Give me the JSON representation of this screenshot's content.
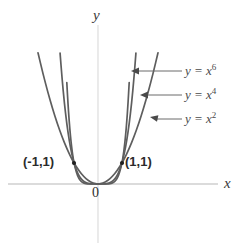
{
  "chart_data": {
    "type": "line",
    "title": "",
    "xlabel": "x",
    "ylabel": "y",
    "xlim": [
      -2.1,
      2.1
    ],
    "ylim": [
      -0.55,
      5.9
    ],
    "grid": false,
    "legend_position": "right-inline-annotations",
    "axes": {
      "x_label": "x",
      "y_label": "y",
      "origin_label": "0",
      "origin_pixel": [
        98,
        184
      ],
      "unit_px_x": 24,
      "unit_px_y": 21
    },
    "series": [
      {
        "name": "y = x^6",
        "label_text": "y = x",
        "label_exponent": "6",
        "exponent": 6,
        "color": "#5e5e5e",
        "points": [
          [
            -1.36,
            6.35
          ],
          [
            -1.3,
            4.83
          ],
          [
            -1.25,
            3.81
          ],
          [
            -1.2,
            2.99
          ],
          [
            -1.15,
            2.31
          ],
          [
            -1.1,
            1.77
          ],
          [
            -1.05,
            1.34
          ],
          [
            -1.0,
            1.0
          ],
          [
            -0.9,
            0.531
          ],
          [
            -0.8,
            0.262
          ],
          [
            -0.7,
            0.118
          ],
          [
            -0.6,
            0.047
          ],
          [
            -0.5,
            0.016
          ],
          [
            -0.4,
            0.004
          ],
          [
            -0.3,
            0.0007
          ],
          [
            -0.2,
            6e-05
          ],
          [
            0,
            0
          ],
          [
            0.2,
            6e-05
          ],
          [
            0.3,
            0.0007
          ],
          [
            0.4,
            0.004
          ],
          [
            0.5,
            0.016
          ],
          [
            0.6,
            0.047
          ],
          [
            0.7,
            0.118
          ],
          [
            0.8,
            0.262
          ],
          [
            0.9,
            0.531
          ],
          [
            1.0,
            1.0
          ],
          [
            1.05,
            1.34
          ],
          [
            1.1,
            1.77
          ],
          [
            1.15,
            2.31
          ],
          [
            1.2,
            2.99
          ],
          [
            1.25,
            3.81
          ],
          [
            1.3,
            4.83
          ],
          [
            1.36,
            6.35
          ]
        ]
      },
      {
        "name": "y = x^4",
        "label_text": "y = x",
        "label_exponent": "4",
        "exponent": 4,
        "color": "#5e5e5e",
        "points": [
          [
            -1.58,
            6.23
          ],
          [
            -1.5,
            5.06
          ],
          [
            -1.4,
            3.84
          ],
          [
            -1.3,
            2.86
          ],
          [
            -1.2,
            2.07
          ],
          [
            -1.1,
            1.46
          ],
          [
            -1.0,
            1.0
          ],
          [
            -0.9,
            0.656
          ],
          [
            -0.8,
            0.41
          ],
          [
            -0.7,
            0.24
          ],
          [
            -0.6,
            0.13
          ],
          [
            -0.5,
            0.0625
          ],
          [
            -0.4,
            0.026
          ],
          [
            -0.3,
            0.008
          ],
          [
            -0.2,
            0.0016
          ],
          [
            0,
            0
          ],
          [
            0.2,
            0.0016
          ],
          [
            0.3,
            0.008
          ],
          [
            0.4,
            0.026
          ],
          [
            0.5,
            0.0625
          ],
          [
            0.6,
            0.13
          ],
          [
            0.7,
            0.24
          ],
          [
            0.8,
            0.41
          ],
          [
            0.9,
            0.656
          ],
          [
            1.0,
            1.0
          ],
          [
            1.1,
            1.46
          ],
          [
            1.2,
            2.07
          ],
          [
            1.3,
            2.86
          ],
          [
            1.4,
            3.84
          ],
          [
            1.5,
            5.06
          ],
          [
            1.58,
            6.23
          ]
        ]
      },
      {
        "name": "y = x^2",
        "label_text": "y = x",
        "label_exponent": "2",
        "exponent": 2,
        "color": "#5e5e5e",
        "points": [
          [
            -2.5,
            6.25
          ],
          [
            -2.3,
            5.29
          ],
          [
            -2.1,
            4.41
          ],
          [
            -1.9,
            3.61
          ],
          [
            -1.7,
            2.89
          ],
          [
            -1.5,
            2.25
          ],
          [
            -1.3,
            1.69
          ],
          [
            -1.1,
            1.21
          ],
          [
            -1.0,
            1.0
          ],
          [
            -0.8,
            0.64
          ],
          [
            -0.6,
            0.36
          ],
          [
            -0.4,
            0.16
          ],
          [
            -0.2,
            0.04
          ],
          [
            0,
            0
          ],
          [
            0.2,
            0.04
          ],
          [
            0.4,
            0.16
          ],
          [
            0.6,
            0.36
          ],
          [
            0.8,
            0.64
          ],
          [
            1.0,
            1.0
          ],
          [
            1.1,
            1.21
          ],
          [
            1.3,
            1.69
          ],
          [
            1.5,
            2.25
          ],
          [
            1.7,
            2.89
          ],
          [
            1.9,
            3.61
          ],
          [
            2.1,
            4.41
          ],
          [
            2.3,
            5.29
          ],
          [
            2.5,
            6.25
          ]
        ]
      }
    ],
    "marked_points": [
      {
        "label": "(-1,1)",
        "x": -1,
        "y": 1
      },
      {
        "label": "(1,1)",
        "x": 1,
        "y": 1
      }
    ],
    "annotations": [
      {
        "label": "y = x^6",
        "target_series": "y = x^6",
        "arrow": "left"
      },
      {
        "label": "y = x^4",
        "target_series": "y = x^4",
        "arrow": "left"
      },
      {
        "label": "y = x^2",
        "target_series": "y = x^2",
        "arrow": "left"
      }
    ],
    "colors": {
      "curve": "#5e5e5e",
      "axis": "#cfcfcf",
      "text": "#2e2e2e",
      "annotation": "#6b6b6b",
      "background": "#ffffff"
    }
  }
}
